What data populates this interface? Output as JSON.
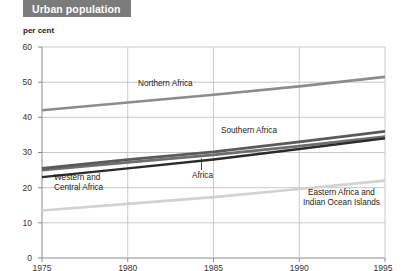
{
  "title": "Urban population",
  "axis_unit": "per cent",
  "colors": {
    "title_banner_bg": "#7b7b7b",
    "title_banner_text": "#ffffff",
    "grid": "#c9c9c9",
    "axis": "#8a8a8a",
    "text": "#1a1a1a",
    "northern_africa": "#8c8c8c",
    "southern_africa": "#5a5a5a",
    "africa": "#2b2b2b",
    "western_central_africa": "#6e6e6e",
    "eastern_africa": "#d2d2d2"
  },
  "chart_data": {
    "type": "line",
    "title": "Urban population",
    "xlabel": "",
    "ylabel": "per cent",
    "x": [
      1975,
      1980,
      1985,
      1990,
      1995
    ],
    "xlim": [
      1975,
      1995
    ],
    "ylim": [
      0,
      60
    ],
    "yticks": [
      0,
      10,
      20,
      30,
      40,
      50,
      60
    ],
    "xticks": [
      "1975",
      "1980",
      "1985",
      "1990",
      "1995"
    ],
    "grid": true,
    "legend": "inline-labels",
    "series": [
      {
        "name": "Northern Africa",
        "color": "#8c8c8c",
        "values": [
          42.0,
          44.2,
          46.4,
          48.8,
          51.5
        ],
        "label_x": 1981.0,
        "label_y": 47.0
      },
      {
        "name": "Southern Africa",
        "color": "#5a5a5a",
        "values": [
          25.5,
          28.0,
          30.2,
          33.0,
          36.0
        ],
        "label_x": 1987.2,
        "label_y": 36.4
      },
      {
        "name": "Africa",
        "color": "#2b2b2b",
        "values": [
          23.0,
          25.5,
          28.0,
          31.0,
          34.0
        ],
        "label_x": 1984.3,
        "label_y": 23.3
      },
      {
        "name": "Western and Central Africa",
        "color": "#6e6e6e",
        "values": [
          25.0,
          27.2,
          29.3,
          31.8,
          34.5
        ],
        "label_x": 1976.3,
        "label_y": 22.5
      },
      {
        "name": "Eastern Africa and Indian Ocean Islands",
        "color": "#d2d2d2",
        "values": [
          13.5,
          15.4,
          17.3,
          19.6,
          22.0
        ],
        "label_x": 1991.2,
        "label_y": 18.6
      }
    ],
    "annotations": [
      {
        "text": "Africa",
        "leader_from": [
          1984.3,
          25.0
        ],
        "leader_to": [
          1984.3,
          28.3
        ]
      }
    ]
  },
  "labels": {
    "northern_africa": "Northern Africa",
    "southern_africa": "Southern Africa",
    "africa": "Africa",
    "western_central_line1": "Western and",
    "western_central_line2": "Central Africa",
    "eastern_line1": "Eastern Africa and",
    "eastern_line2": "Indian Ocean Islands"
  },
  "yticks": {
    "t0": "0",
    "t10": "10",
    "t20": "20",
    "t30": "30",
    "t40": "40",
    "t50": "50",
    "t60": "60"
  },
  "xticks": {
    "x1975": "1975",
    "x1980": "1980",
    "x1985": "1985",
    "x1990": "1990",
    "x1995": "1995"
  }
}
